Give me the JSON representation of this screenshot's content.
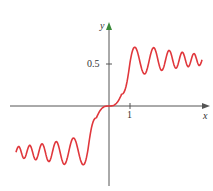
{
  "chart_data": {
    "type": "line",
    "title": "",
    "xlabel": "x",
    "ylabel": "y",
    "x_ticks": [
      "1"
    ],
    "y_ticks": [
      "0.5"
    ],
    "series": [
      {
        "name": "curve",
        "color": "#e0373c",
        "description": "odd function rising through origin, peaking ~0.7 near x≈1.2 then damped oscillation about ~0.55; mirrored below for x<0"
      }
    ],
    "grid": false
  },
  "labels": {
    "y": "y",
    "x": "x",
    "xtick": "1",
    "ytick": "0.5"
  }
}
